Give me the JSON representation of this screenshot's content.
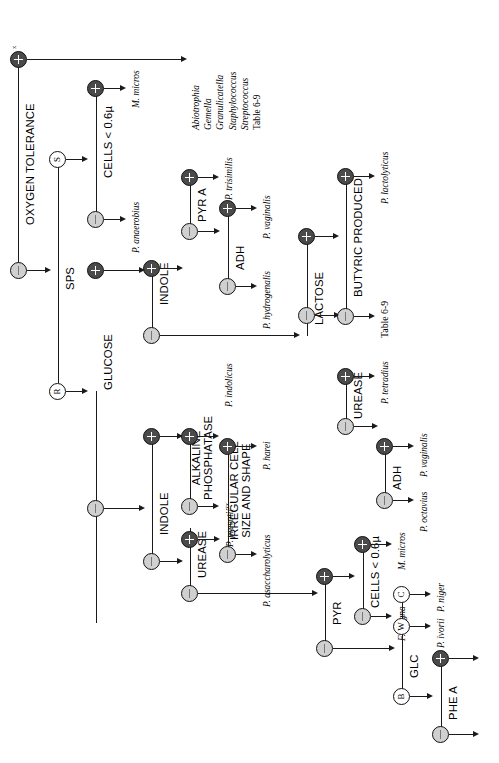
{
  "diagram": {
    "type": "dichotomous-key-flowchart",
    "orientation": "rotated-90-ccw",
    "colors": {
      "positive_node": "#4a4a4a",
      "negative_node": "#d0d0d0",
      "letter_node": "#ffffff",
      "line": "#1a1a1a"
    },
    "tests": {
      "oxygen_tolerance": "OXYGEN TOLERANCE",
      "sps": "SPS",
      "cells_small_1": "CELLS < 0.6µ",
      "indole_1": "INDOLE",
      "pyr_a": "PYR A",
      "adh_1": "ADH",
      "lactose": "LACTOSE",
      "butyric": "BUTYRIC PRODUCED",
      "glucose": "GLUCOSE",
      "indole_2": "INDOLE",
      "alkaline_phosphatase_l1": "ALKALINE",
      "alkaline_phosphatase_l2": "PHOSPHATASE",
      "irregular_l1": "IRREGULAR CELL",
      "irregular_l2": "SIZE AND SHAPE",
      "urease_1": "UREASE",
      "urease_2": "UREASE",
      "adh_2": "ADH",
      "pyr": "PYR",
      "cells_small_2": "CELLS < 0.6µ",
      "glc": "GLC",
      "phe_a": "PHE A"
    },
    "letter_nodes": {
      "sensitive": "S",
      "resistant": "R",
      "c": "C",
      "w": "W",
      "b": "B"
    },
    "node_signs": {
      "positive": "+",
      "negative": "–"
    },
    "organisms": {
      "m_micros_1": "M. micros",
      "p_anaerobius": "P. anaerobius",
      "p_trisimilis": "P. trisimilis",
      "p_vaginalis_1": "P. vaginalis",
      "p_hydrogenalis": "P. hydrogenalis",
      "p_lactolyticus": "P. lactolyticus",
      "p_indolicus": "P. indolicus",
      "p_prevotii": "P. prevotii",
      "p_prevotii_sup": "xx",
      "p_harei": "P. harei",
      "p_asaccharolyticus": "P. asaccharolyticus",
      "p_tetradius": "P. tetradius",
      "p_vaginalis_2": "P. vaginalis",
      "p_octavius": "P. octavius",
      "m_micros_2": "M. micros",
      "f_magna": "F. magna",
      "p_niger": "P. niger",
      "p_ivorii": "P. ivorii"
    },
    "table_refs": {
      "table_69_top": "Table 6-9",
      "table_69_mid": "Table 6-9"
    },
    "aerobe_list": {
      "items": [
        "Abiotrophia",
        "Gemella",
        "Granulicatella",
        "Staphylococcus",
        "Streptococcus"
      ],
      "table_ref": "Table 6-9"
    },
    "superscripts": {
      "oxygen_tolerance_pos": "x"
    }
  }
}
